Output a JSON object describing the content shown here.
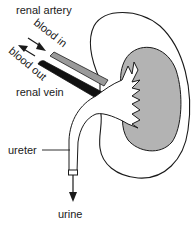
{
  "diagram": {
    "labels": {
      "renal_artery": "renal artery",
      "blood_in": "blood in",
      "blood_out": "blood out",
      "renal_vein": "renal vein",
      "ureter": "ureter",
      "urine": "urine"
    },
    "colors": {
      "outline": "#1a1a1a",
      "medulla": "#b3b3b3",
      "artery": "#9a9a9a",
      "vein": "#111111",
      "background": "#ffffff"
    }
  }
}
